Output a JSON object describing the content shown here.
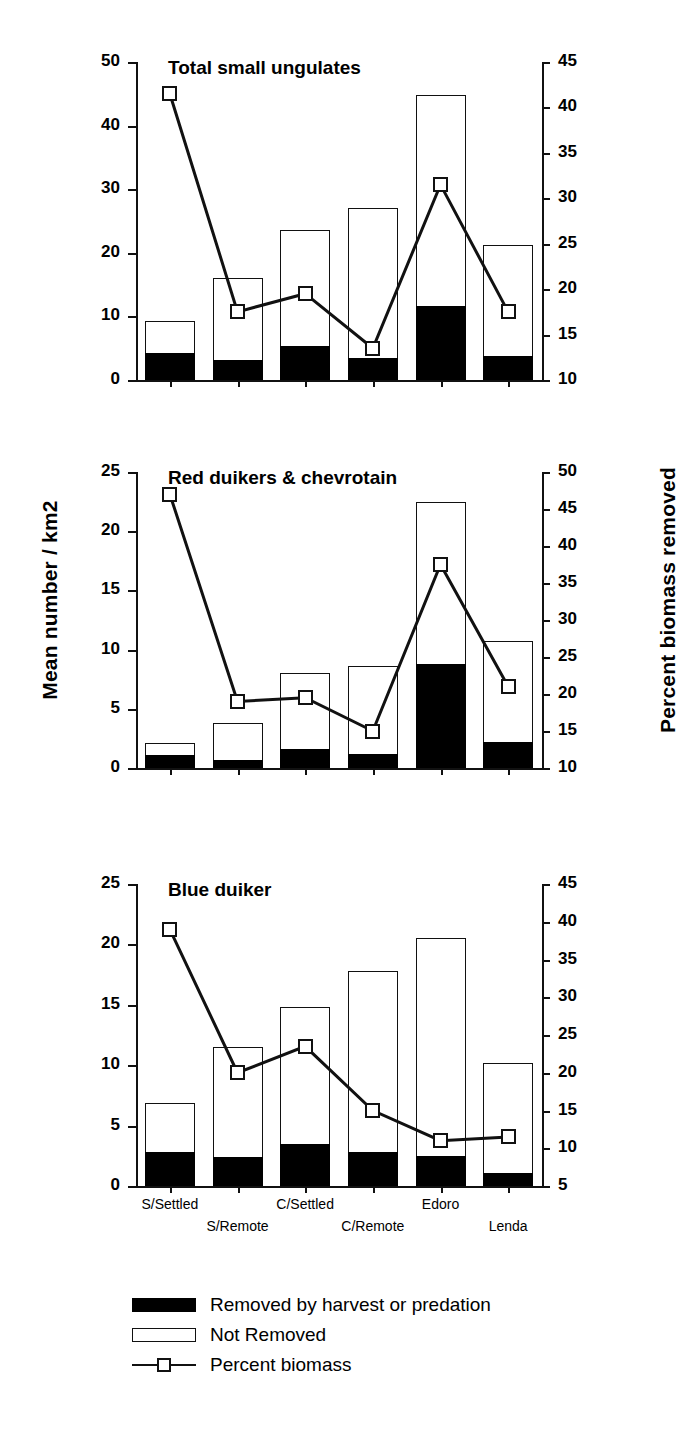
{
  "figure": {
    "y_axis_left_title": "Mean number / km2",
    "y_axis_right_title": "Percent biomass removed"
  },
  "legend": {
    "items": [
      {
        "key": "removed",
        "label": "Removed by harvest or predation",
        "swatch": "filled-black-rectangle"
      },
      {
        "key": "not_removed",
        "label": "Not Removed",
        "swatch": "open-white-rectangle"
      },
      {
        "key": "percent_biomass",
        "label": "Percent biomass",
        "swatch": "line-with-open-square-marker"
      }
    ]
  },
  "x_axis": {
    "categories": [
      "S/Settled",
      "S/Remote",
      "C/Settled",
      "C/Remote",
      "Edoro",
      "Lenda"
    ]
  },
  "chart_data": [
    {
      "type": "bar",
      "id": "total-small-ungulates",
      "title": "Total small ungulates",
      "xlabel": "",
      "ylabel": "Mean number / km2",
      "y2label": "Percent biomass removed",
      "categories": [
        "S/Settled",
        "S/Remote",
        "C/Settled",
        "C/Remote",
        "Edoro",
        "Lenda"
      ],
      "ylim": [
        0,
        50
      ],
      "yticks": [
        0,
        10,
        20,
        30,
        40,
        50
      ],
      "y2lim": [
        10,
        45
      ],
      "y2ticks": [
        10,
        15,
        20,
        25,
        30,
        35,
        40,
        45
      ],
      "grid": false,
      "stacked": true,
      "series": [
        {
          "name": "Removed by harvest or predation",
          "axis": "left",
          "values": [
            4.3,
            3.1,
            5.3,
            3.4,
            11.7,
            3.8
          ]
        },
        {
          "name": "Not Removed",
          "axis": "left",
          "values": [
            5.0,
            12.9,
            18.3,
            23.6,
            33.1,
            17.5
          ]
        },
        {
          "name": "Total",
          "axis": "left",
          "values": [
            9.3,
            16.0,
            23.6,
            27.0,
            44.8,
            21.3
          ]
        },
        {
          "name": "Percent biomass",
          "axis": "right",
          "type": "line",
          "values": [
            41.5,
            17.5,
            19.5,
            13.5,
            31.5,
            17.5
          ]
        }
      ]
    },
    {
      "type": "bar",
      "id": "red-duikers-chevrotain",
      "title": "Red duikers & chevrotain",
      "xlabel": "",
      "ylabel": "Mean number / km2",
      "y2label": "Percent biomass removed",
      "categories": [
        "S/Settled",
        "S/Remote",
        "C/Settled",
        "C/Remote",
        "Edoro",
        "Lenda"
      ],
      "ylim": [
        0,
        25
      ],
      "yticks": [
        0,
        5,
        10,
        15,
        20,
        25
      ],
      "y2lim": [
        10,
        50
      ],
      "y2ticks": [
        10,
        15,
        20,
        25,
        30,
        35,
        40,
        45,
        50
      ],
      "grid": false,
      "stacked": true,
      "series": [
        {
          "name": "Removed by harvest or predation",
          "axis": "left",
          "values": [
            1.1,
            0.7,
            1.6,
            1.2,
            8.8,
            2.2
          ]
        },
        {
          "name": "Not Removed",
          "axis": "left",
          "values": [
            1.0,
            3.1,
            6.4,
            7.4,
            13.7,
            8.5
          ]
        },
        {
          "name": "Total",
          "axis": "left",
          "values": [
            2.1,
            3.8,
            8.0,
            8.6,
            22.5,
            10.7
          ]
        },
        {
          "name": "Percent biomass",
          "axis": "right",
          "type": "line",
          "values": [
            47.0,
            19.0,
            19.5,
            15.0,
            37.5,
            21.0
          ]
        }
      ]
    },
    {
      "type": "bar",
      "id": "blue-duiker",
      "title": "Blue duiker",
      "xlabel": "",
      "ylabel": "Mean number / km2",
      "y2label": "Percent biomass removed",
      "categories": [
        "S/Settled",
        "S/Remote",
        "C/Settled",
        "C/Remote",
        "Edoro",
        "Lenda"
      ],
      "ylim": [
        0,
        25
      ],
      "yticks": [
        0,
        5,
        10,
        15,
        20,
        25
      ],
      "y2lim": [
        5,
        45
      ],
      "y2ticks": [
        5,
        10,
        15,
        20,
        25,
        30,
        35,
        40,
        45
      ],
      "grid": false,
      "stacked": true,
      "series": [
        {
          "name": "Removed by harvest or predation",
          "axis": "left",
          "values": [
            2.8,
            2.4,
            3.5,
            2.8,
            2.5,
            1.1
          ]
        },
        {
          "name": "Not Removed",
          "axis": "left",
          "values": [
            4.1,
            9.1,
            11.3,
            15.0,
            18.0,
            9.1
          ]
        },
        {
          "name": "Total",
          "axis": "left",
          "values": [
            6.9,
            11.5,
            14.8,
            17.8,
            20.5,
            10.2
          ]
        },
        {
          "name": "Percent biomass",
          "axis": "right",
          "type": "line",
          "values": [
            39.0,
            20.0,
            23.5,
            15.0,
            11.0,
            11.5
          ]
        }
      ]
    }
  ]
}
